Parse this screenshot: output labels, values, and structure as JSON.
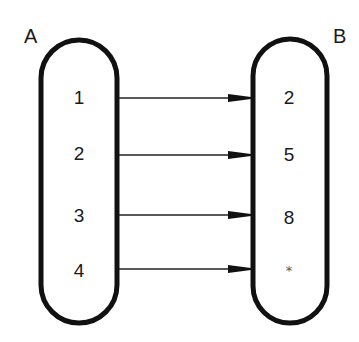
{
  "diagram": {
    "type": "mapping",
    "sets": [
      {
        "name": "A",
        "elements": [
          "1",
          "2",
          "3",
          "4"
        ]
      },
      {
        "name": "B",
        "elements": [
          "2",
          "5",
          "8",
          "*"
        ]
      }
    ],
    "mappings": [
      {
        "from": "1",
        "to": "2"
      },
      {
        "from": "2",
        "to": "5"
      },
      {
        "from": "3",
        "to": "8"
      },
      {
        "from": "4",
        "to": "*"
      }
    ],
    "colors": {
      "stroke": "#111111",
      "background": "#ffffff"
    }
  }
}
